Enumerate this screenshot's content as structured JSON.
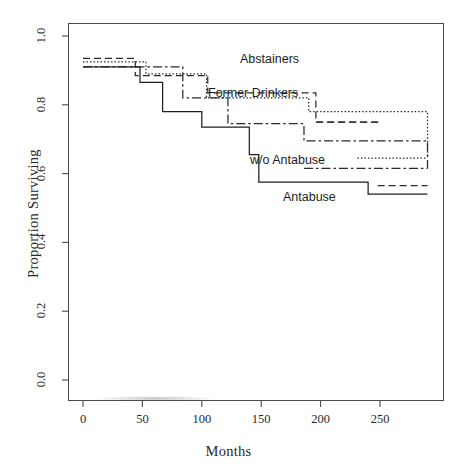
{
  "figure": {
    "kind": "kaplan-meier-survival-plot",
    "background": "#ffffff",
    "frame_color": "#4a4a4a"
  },
  "axes": {
    "x_title": "Months",
    "y_title": "Proportion Surviving",
    "x_ticks": [
      "0",
      "50",
      "100",
      "150",
      "200",
      "250"
    ],
    "y_ticks": [
      "0.0",
      "0.2",
      "0.4",
      "0.6",
      "0.8",
      "1.0"
    ]
  },
  "annotations": [
    {
      "name": "abstainers-label",
      "text": "Abstainers",
      "x": 240,
      "y": 52
    },
    {
      "name": "former-drinkers-label",
      "text": "Former Drinkers",
      "x": 208,
      "y": 86
    },
    {
      "name": "wo-antabuse-label",
      "text": "w/o Antabuse",
      "x": 250,
      "y": 153
    },
    {
      "name": "antabuse-label",
      "text": "Antabuse",
      "x": 283,
      "y": 190
    }
  ],
  "chart_data": {
    "type": "line",
    "title": "",
    "subtitle": "",
    "xlabel": "Months",
    "ylabel": "Proportion Surviving",
    "xlim": [
      -8,
      309
    ],
    "ylim": [
      -0.02,
      1.08
    ],
    "grid": false,
    "legend_position": "inline-annotations",
    "step_interpolation": "post",
    "series": [
      {
        "name": "Abstainers",
        "linestyle": "dashed",
        "dasharray": "7,4",
        "color": "#2b2b2b",
        "x": [
          0,
          28,
          44,
          65,
          105,
          165,
          196,
          250
        ],
        "y": [
          0.935,
          0.935,
          0.885,
          0.885,
          0.835,
          0.835,
          0.75,
          0.75
        ]
      },
      {
        "name": "Former Drinkers",
        "linestyle": "dotted",
        "dasharray": "1.5,2",
        "color": "#2b2b2b",
        "x": [
          0,
          40,
          53,
          72,
          104,
          155,
          190,
          231,
          290
        ],
        "y": [
          0.925,
          0.925,
          0.89,
          0.89,
          0.82,
          0.82,
          0.78,
          0.78,
          0.645
        ]
      },
      {
        "name": "w/o Antabuse",
        "linestyle": "dashdot",
        "dasharray": "9,3,2.5,3",
        "color": "#2b2b2b",
        "x": [
          0,
          50,
          84,
          122,
          152,
          186,
          240,
          290
        ],
        "y": [
          0.91,
          0.91,
          0.82,
          0.745,
          0.745,
          0.695,
          0.695,
          0.615
        ]
      },
      {
        "name": "Antabuse",
        "linestyle": "solid",
        "dasharray": "none",
        "color": "#1f1f1f",
        "x": [
          0,
          36,
          48,
          67,
          80,
          100,
          118,
          140,
          148,
          205,
          240,
          290
        ],
        "y": [
          0.91,
          0.91,
          0.865,
          0.78,
          0.78,
          0.735,
          0.735,
          0.655,
          0.575,
          0.575,
          0.54,
          0.54
        ]
      }
    ],
    "series_late_segments": [
      {
        "series": "Abstainers",
        "x": [
          196,
          250
        ],
        "y": 0.75
      },
      {
        "series": "Abstainers",
        "x": [
          248,
          290
        ],
        "y": 0.565
      },
      {
        "series": "Former Drinkers",
        "x": [
          231,
          290
        ],
        "y": 0.645
      },
      {
        "series": "w/o Antabuse",
        "x": [
          186,
          290
        ],
        "y": 0.615
      }
    ]
  }
}
